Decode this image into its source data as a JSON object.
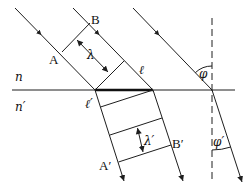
{
  "diagram": {
    "media": {
      "upper": "n",
      "lower": "n′"
    },
    "labels": {
      "A": "A",
      "B": "B",
      "lambda": "λ",
      "ell": "ℓ",
      "ell_prime": "ℓ′",
      "A_prime": "A′",
      "B_prime": "B′",
      "lambda_prime": "λ′",
      "phi": "φ",
      "phi_prime": "φ′"
    },
    "colors": {
      "line": "#1e1e1e",
      "background": "#ffffff"
    }
  }
}
